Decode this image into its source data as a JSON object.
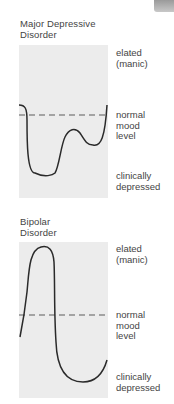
{
  "figure": {
    "corner_tab": "",
    "panels": [
      {
        "title_line1": "Major Depressive",
        "title_line2": "Disorder",
        "labels": {
          "elated_1": "elated",
          "elated_2": "(manic)",
          "normal_1": "normal",
          "normal_2": "mood",
          "normal_3": "level",
          "depressed_1": "clinically",
          "depressed_2": "depressed"
        }
      },
      {
        "title_line1": "Bipolar",
        "title_line2": "Disorder",
        "labels": {
          "elated_1": "elated",
          "elated_2": "(manic)",
          "normal_1": "normal",
          "normal_2": "mood",
          "normal_3": "level",
          "depressed_1": "clinically",
          "depressed_2": "depressed"
        }
      }
    ],
    "colors": {
      "panel_bg": "#ececec",
      "curve": "#2a2a2a",
      "dashed_line": "#8a8a8a",
      "text": "#444444"
    }
  }
}
